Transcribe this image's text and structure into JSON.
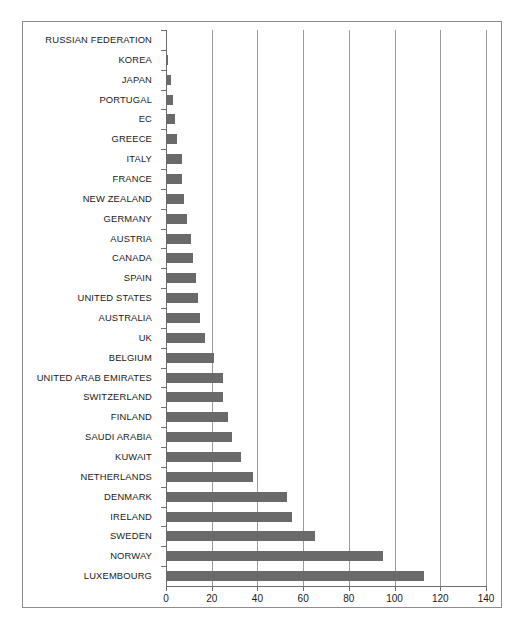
{
  "chart_data": {
    "type": "bar",
    "orientation": "horizontal",
    "title": "",
    "subtitle": "",
    "xlabel": "",
    "ylabel": "",
    "xlim": [
      0,
      140
    ],
    "xticks": [
      0,
      20,
      40,
      60,
      80,
      100,
      120,
      140
    ],
    "xtick_labels": [
      "0",
      "20",
      "40",
      "60",
      "80",
      "100",
      "120",
      "140"
    ],
    "grid": "vertical",
    "legend": "none",
    "bar_color": "#6a6a6a",
    "gridline_color": "#9a9a9a",
    "axis_color": "#6f6f6f",
    "frame_color": "#8d8d8d",
    "categories": [
      "RUSSIAN FEDERATION",
      "KOREA",
      "JAPAN",
      "PORTUGAL",
      "EC",
      "GREECE",
      "ITALY",
      "FRANCE",
      "NEW ZEALAND",
      "GERMANY",
      "AUSTRIA",
      "CANADA",
      "SPAIN",
      "UNITED STATES",
      "AUSTRALIA",
      "UK",
      "BELGIUM",
      "UNITED ARAB EMIRATES",
      "SWITZERLAND",
      "FINLAND",
      "SAUDI ARABIA",
      "KUWAIT",
      "NETHERLANDS",
      "DENMARK",
      "IRELAND",
      "SWEDEN",
      "NORWAY",
      "LUXEMBOURG"
    ],
    "values": [
      0,
      1,
      2,
      3,
      4,
      5,
      7,
      7,
      8,
      9,
      11,
      12,
      13,
      14,
      15,
      17,
      21,
      25,
      25,
      27,
      29,
      33,
      38,
      53,
      55,
      65,
      95,
      113
    ]
  }
}
